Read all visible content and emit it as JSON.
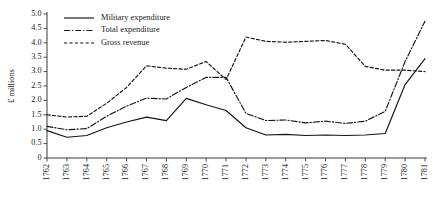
{
  "chart_data": {
    "type": "line",
    "title": "",
    "xlabel": "",
    "ylabel": "£ millions",
    "xlim": [
      1762,
      1781
    ],
    "ylim": [
      0,
      5.0
    ],
    "grid": false,
    "legend_position": "upper-left-inside",
    "ytick_labels": [
      "0",
      "0.5",
      "1.0",
      "1.5",
      "2.0",
      "2.5",
      "3.0",
      "3.5",
      "4.0",
      "4.5",
      "5.0"
    ],
    "ytick_values": [
      0,
      0.5,
      1.0,
      1.5,
      2.0,
      2.5,
      3.0,
      3.5,
      4.0,
      4.5,
      5.0
    ],
    "categories": [
      "1762",
      "1763",
      "1764",
      "1765",
      "1766",
      "1767",
      "1768",
      "1769",
      "1770",
      "1771",
      "1772",
      "1773",
      "1774",
      "1775",
      "1776",
      "1777",
      "1778",
      "1779",
      "1780",
      "1781"
    ],
    "x": [
      1762,
      1763,
      1764,
      1765,
      1766,
      1767,
      1768,
      1769,
      1770,
      1771,
      1772,
      1773,
      1774,
      1775,
      1776,
      1777,
      1778,
      1779,
      1780,
      1781
    ],
    "series": [
      {
        "name": "Military expenditure",
        "style": "solid",
        "values": [
          0.95,
          0.72,
          0.78,
          1.05,
          1.25,
          1.42,
          1.3,
          2.07,
          1.85,
          1.65,
          1.05,
          0.8,
          0.82,
          0.78,
          0.8,
          0.78,
          0.8,
          0.85,
          2.55,
          3.45
        ]
      },
      {
        "name": "Total expenditure",
        "style": "dashdot",
        "values": [
          1.1,
          0.98,
          1.02,
          1.45,
          1.8,
          2.08,
          2.05,
          2.45,
          2.8,
          2.8,
          1.55,
          1.3,
          1.32,
          1.22,
          1.28,
          1.2,
          1.28,
          1.62,
          3.35,
          4.75
        ]
      },
      {
        "name": "Gross revenue",
        "style": "dashed",
        "values": [
          1.5,
          1.42,
          1.45,
          1.9,
          2.45,
          3.2,
          3.12,
          3.08,
          3.35,
          2.72,
          4.2,
          4.05,
          4.02,
          4.05,
          4.08,
          3.95,
          3.18,
          3.05,
          3.05,
          3.0
        ]
      }
    ]
  },
  "legend": {
    "entries": [
      {
        "label": "Military expenditure"
      },
      {
        "label": "Total expenditure"
      },
      {
        "label": "Gross revenue"
      }
    ]
  },
  "colors": {
    "ink": "#141414",
    "axis": "#3a3a3a",
    "background": "#ffffff"
  }
}
